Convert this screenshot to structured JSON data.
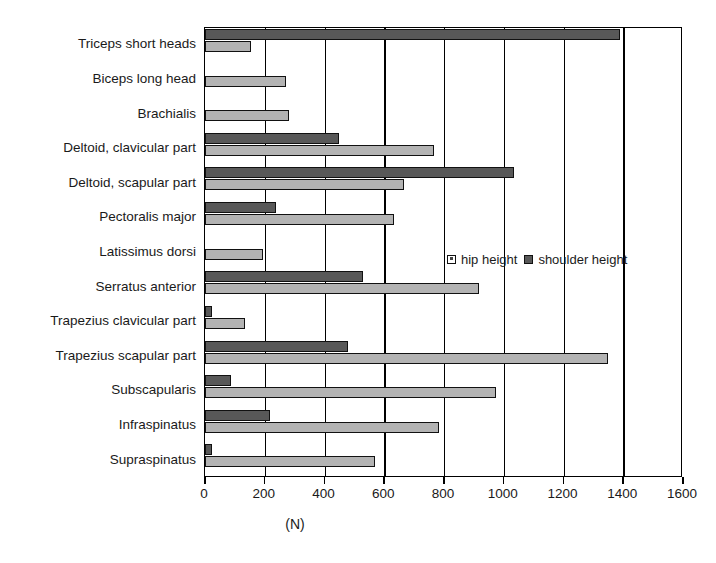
{
  "title_fragment": "",
  "chart_data": {
    "type": "bar",
    "orientation": "horizontal",
    "title": "",
    "xlabel": "(N)",
    "ylabel": "",
    "xlim": [
      0,
      1600
    ],
    "xticks": [
      0,
      200,
      400,
      600,
      800,
      1000,
      1200,
      1400,
      1600
    ],
    "grid": "vertical",
    "legend_position": "center-right",
    "categories": [
      "Triceps short heads",
      "Biceps long head",
      "Brachialis",
      "Deltoid, clavicular part",
      "Deltoid, scapular part",
      "Pectoralis major",
      "Latissimus dorsi",
      "Serratus anterior",
      "Trapezius clavicular part",
      "Trapezius scapular part",
      "Subscapularis",
      "Infraspinatus",
      "Supraspinatus"
    ],
    "series": [
      {
        "name": "shoulder height",
        "color": "#585858",
        "values": [
          1389,
          0,
          0,
          449,
          1035,
          238,
          0,
          529,
          25,
          480,
          87,
          218,
          25
        ]
      },
      {
        "name": "hip height",
        "color": "#b3b3b3",
        "values": [
          154,
          271,
          281,
          766,
          666,
          633,
          194,
          918,
          135,
          1350,
          974,
          784,
          570
        ]
      }
    ]
  },
  "legend": {
    "items": [
      {
        "label": "hip height",
        "swatch": "hip"
      },
      {
        "label": "shoulder height",
        "swatch": "shoulder"
      }
    ]
  },
  "colors": {
    "shoulder": "#585858",
    "hip": "#b3b3b3",
    "axis": "#000000",
    "background": "#ffffff"
  }
}
